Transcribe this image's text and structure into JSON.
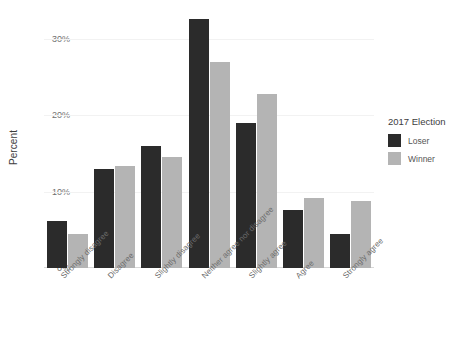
{
  "chart_data": {
    "type": "bar",
    "title": "",
    "xlabel": "",
    "ylabel": "Percent",
    "ylim": [
      0,
      34
    ],
    "yticks": [
      0,
      10,
      20,
      30
    ],
    "ytick_labels": [
      "0%",
      "10%",
      "20%",
      "30%"
    ],
    "grid": true,
    "legend_position": "right",
    "legend_title": "2017 Election",
    "categories": [
      "Strongly disagree",
      "Disagree",
      "Slightly disagree",
      "Neither agree nor disagree",
      "Slightly agree",
      "Agree",
      "Strongly agree"
    ],
    "series": [
      {
        "name": "Loser",
        "color": "#2b2b2b",
        "values": [
          6.2,
          12.9,
          16.0,
          32.6,
          18.9,
          7.6,
          4.5
        ]
      },
      {
        "name": "Winner",
        "color": "#b4b4b4",
        "values": [
          4.5,
          13.4,
          14.5,
          26.9,
          22.8,
          9.2,
          8.8
        ]
      }
    ]
  },
  "axis": {
    "y_title": "Percent"
  },
  "legend": {
    "title": "2017 Election",
    "entries": [
      {
        "label": "Loser",
        "color": "#2b2b2b"
      },
      {
        "label": "Winner",
        "color": "#b4b4b4"
      }
    ]
  }
}
